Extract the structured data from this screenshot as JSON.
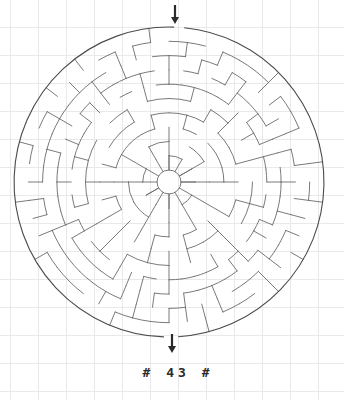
{
  "page": {
    "background_color": "#ffffff",
    "grid_color": "#e9e9ec",
    "grid_spacing": 28,
    "width": 344,
    "height": 400
  },
  "puzzle": {
    "type": "circular-maze",
    "label": "#  43  #",
    "label_text_color": "#2b2b2b",
    "wall_color": "#6b6b6b",
    "border_color": "#4a4a4a",
    "arrow_color": "#2b2b2b",
    "center": {
      "x": 169,
      "y": 182
    },
    "outer_radius": 155,
    "hub_radius": 12,
    "ring_count": 10,
    "base_sectors": 12,
    "seed": 43,
    "entrance": {
      "name": "top-entrance",
      "angle_deg": -90,
      "arrow_x": 175,
      "arrow_y_from": 5,
      "arrow_y_to": 24,
      "direction": "down"
    },
    "exit": {
      "name": "bottom-exit",
      "angle_deg": 90,
      "arrow_x": 172,
      "arrow_y_from": 334,
      "arrow_y_to": 353,
      "direction": "down"
    }
  }
}
